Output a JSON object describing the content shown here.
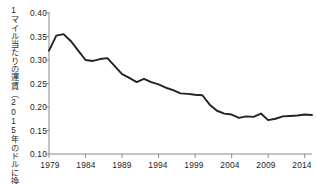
{
  "chart_data": {
    "type": "line",
    "title": "",
    "subtitle": "",
    "xlabel": "",
    "ylabel": "1マイル当たりの運賃（2015年のドルに換算）",
    "xlim": [
      1979,
      2015
    ],
    "ylim": [
      0.1,
      0.4
    ],
    "grid": false,
    "legend": null,
    "y_ticks": [
      "0.40",
      "0.35",
      "0.30",
      "0.25",
      "0.20",
      "0.15",
      "0.10"
    ],
    "y_tick_values": [
      0.4,
      0.35,
      0.3,
      0.25,
      0.2,
      0.15,
      0.1
    ],
    "x_ticks": [
      "1979",
      "1984",
      "1989",
      "1994",
      "1999",
      "2004",
      "2009",
      "2014"
    ],
    "x_tick_values": [
      1979,
      1984,
      1989,
      1994,
      1999,
      2004,
      2009,
      2014
    ],
    "line_color": "#222222",
    "axis_color": "#8a8a8a",
    "series": [
      {
        "name": "1マイル当たりの運賃",
        "x": [
          1979,
          1980,
          1981,
          1982,
          1983,
          1984,
          1985,
          1986,
          1987,
          1988,
          1989,
          1990,
          1991,
          1992,
          1993,
          1994,
          1995,
          1996,
          1997,
          1998,
          1999,
          2000,
          2001,
          2002,
          2003,
          2004,
          2005,
          2006,
          2007,
          2008,
          2009,
          2010,
          2011,
          2012,
          2013,
          2014,
          2015
        ],
        "values": [
          0.32,
          0.352,
          0.355,
          0.34,
          0.32,
          0.3,
          0.298,
          0.302,
          0.304,
          0.287,
          0.27,
          0.262,
          0.253,
          0.26,
          0.253,
          0.248,
          0.241,
          0.236,
          0.229,
          0.228,
          0.226,
          0.225,
          0.205,
          0.192,
          0.186,
          0.184,
          0.177,
          0.18,
          0.179,
          0.186,
          0.172,
          0.175,
          0.18,
          0.181,
          0.182,
          0.184,
          0.183
        ]
      }
    ]
  }
}
